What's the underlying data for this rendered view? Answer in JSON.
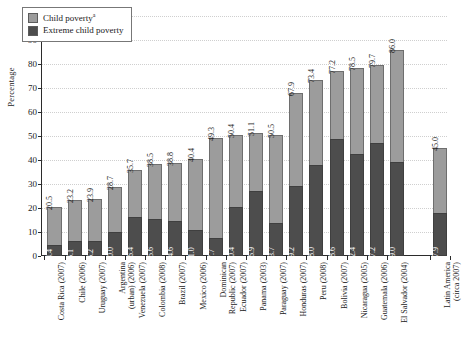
{
  "chart_data": {
    "type": "bar",
    "subtype": "stacked-vertical",
    "title": "",
    "xlabel": "",
    "ylabel": "Percentage",
    "ylim": [
      0,
      100
    ],
    "ytick_step": 10,
    "yticks": [
      "100",
      "90",
      "80",
      "70",
      "60",
      "50",
      "40",
      "30",
      "20",
      "10",
      "0"
    ],
    "grid": "horizontal-dotted",
    "legend_position": "top-left-inside",
    "legend": [
      {
        "label": "Child poverty",
        "superscript": "a",
        "color": "#9c9c9c"
      },
      {
        "label": "Extreme child poverty",
        "superscript": "",
        "color": "#4d4d4d"
      }
    ],
    "categories": [
      "Costa Rica (2007)",
      "Chile (2006)",
      "Uruguay (2007)",
      "Argentina (urban) (2006)",
      "Venezuela (2007)",
      "Colombia (2008)",
      "Brazil (2007)",
      "Mexico (2006)",
      "Dominican Republic (2007)",
      "Ecuador (2007)",
      "Panama (2003)",
      "Paraguay (2007)",
      "Honduras (2007)",
      "Peru (2008)",
      "Bolivia (2007)",
      "Nicaragua (2005)",
      "Guatemala (2006)",
      "El Salvador (2004)",
      "Latin America (circa 2007)"
    ],
    "category_lines": [
      [
        "Costa Rica (2007)"
      ],
      [
        "Chile (2006)"
      ],
      [
        "Uruguay (2007)"
      ],
      [
        "Argentina",
        "(urban) (2006)"
      ],
      [
        "Venezuela (2007)"
      ],
      [
        "Colombia (2008)"
      ],
      [
        "Brazil (2007)"
      ],
      [
        "Mexico (2006)"
      ],
      [
        "Dominican",
        "Republic (2007)"
      ],
      [
        "Ecuador (2007)"
      ],
      [
        "Panama (2003)"
      ],
      [
        "Paraguay (2007)"
      ],
      [
        "Honduras (2007)"
      ],
      [
        "Peru (2008)"
      ],
      [
        "Bolivia (2007)"
      ],
      [
        "Nicaragua (2005)"
      ],
      [
        "Guatemala (2006)"
      ],
      [
        "El Salvador (2004)"
      ],
      [
        "Latin America",
        "(circa 2007)"
      ]
    ],
    "series": [
      {
        "name": "Child poverty",
        "color": "#9c9c9c",
        "values": [
          20.5,
          23.2,
          23.9,
          28.7,
          35.7,
          38.5,
          38.8,
          40.4,
          49.3,
          50.4,
          51.1,
          50.5,
          67.9,
          73.4,
          77.2,
          78.5,
          79.7,
          86.0,
          45.0
        ],
        "labels": [
          "20.5",
          "23.2",
          "23.9",
          "28.7",
          "35.7",
          "38.5",
          "38.8",
          "40.4",
          "49.3",
          "50.4",
          "51.1",
          "50.5",
          "67.9",
          "73.4",
          "77.2",
          "78.5",
          "79.7",
          "86.0",
          "45.0"
        ]
      },
      {
        "name": "Extreme child poverty",
        "color": "#4d4d4d",
        "values": [
          4.4,
          6.1,
          6.2,
          10.0,
          16.4,
          15.6,
          14.6,
          11.0,
          7.7,
          20.4,
          26.9,
          13.7,
          29.2,
          38.0,
          48.6,
          42.4,
          47.2,
          39.0,
          17.9
        ],
        "labels": [
          "4.4",
          "6.1",
          "6.2",
          "10.0",
          "16.4",
          "15.6",
          "14.6",
          "11.0",
          "7.7",
          "20.4",
          "26.9",
          "13.7",
          "29.2",
          "38.0",
          "48.6",
          "42.4",
          "47.2",
          "39.0",
          "17.9"
        ]
      }
    ],
    "separator_after_index": 17
  }
}
